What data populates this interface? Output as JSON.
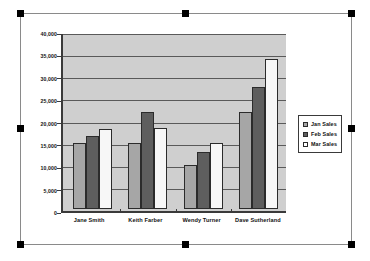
{
  "chart_data": {
    "type": "bar",
    "title": "",
    "subtitle": "",
    "xlabel": "",
    "ylabel": "",
    "categories": [
      "Jane Smith",
      "Keith Farber",
      "Wendy Turner",
      "Dave Sutherland"
    ],
    "series": [
      {
        "name": "Jan Sales",
        "color": "#a6a6a6",
        "values": [
          15000,
          15000,
          10000,
          22200
        ]
      },
      {
        "name": "Feb Sales",
        "color": "#5e5e5e",
        "values": [
          16700,
          22100,
          13000,
          27800
        ]
      },
      {
        "name": "Mar Sales",
        "color": "#f7f7f7",
        "values": [
          18300,
          18600,
          15000,
          34300
        ]
      }
    ],
    "ylim": [
      0,
      40000
    ],
    "ytick_values": [
      0,
      5000,
      10000,
      15000,
      20000,
      25000,
      30000,
      35000,
      40000
    ],
    "ytick_labels": [
      "0",
      "5,000",
      "10,000",
      "15,000",
      "20,000",
      "25,000",
      "30,000",
      "35,000",
      "40,000"
    ],
    "grid": true,
    "legend_position": "right",
    "plot_background": "#cfcfcf",
    "axis_color": "#3a3a3a",
    "gridline_color": "#5a5a5a"
  },
  "selection": {
    "state": "selected",
    "handle_color": "#000000",
    "border_color": "#8a8a8a",
    "handles": [
      "top-left",
      "top-center",
      "top-right",
      "middle-left",
      "middle-right",
      "bottom-left",
      "bottom-center",
      "bottom-right"
    ]
  }
}
